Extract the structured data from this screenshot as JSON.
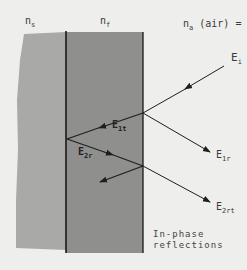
{
  "diagram": {
    "colors": {
      "background": "#eeeeec",
      "substrate": "#a9a9a7",
      "film": "#8f8f8d",
      "boundary": "#1a1a1a",
      "ray": "#1e1e1e"
    },
    "regions": [
      {
        "id": "substrate",
        "label_main": "n",
        "label_sub": "s"
      },
      {
        "id": "film",
        "label_main": "n",
        "label_sub": "f"
      },
      {
        "id": "ambient",
        "label_main": "n",
        "label_sub": "a",
        "label_suffix": " (air) ="
      }
    ],
    "rays": [
      {
        "id": "incident",
        "label_main": "E",
        "label_sub": "i"
      },
      {
        "id": "first-reflected",
        "label_main": "E",
        "label_sub": "1r"
      },
      {
        "id": "first-transmitted",
        "label_main": "E",
        "label_sub": "1t"
      },
      {
        "id": "second-reflected",
        "label_main": "E",
        "label_sub": "2r"
      },
      {
        "id": "second-reflected-transmitted",
        "label_main": "E",
        "label_sub": "2rt"
      }
    ],
    "caption_line1": "In-phase",
    "caption_line2": "reflections"
  }
}
